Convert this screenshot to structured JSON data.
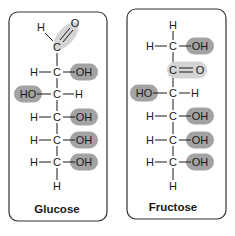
{
  "colors": {
    "hydroxyl_highlight": "#a3a3a3",
    "carbonyl_highlight": "#d4d4d4",
    "text": "#1a1a1a",
    "border": "#333333"
  },
  "molecules": [
    {
      "name": "Glucose",
      "box": {
        "x": 9,
        "y": 12,
        "w": 98,
        "h": 209
      },
      "carbon_x": 57,
      "label_y": 209,
      "top_group": {
        "type": "aldehyde",
        "c_y": 47,
        "h_label": "H",
        "o_label": "O",
        "c_label": "C"
      },
      "rows": [
        {
          "y": 72,
          "left": "H",
          "right": "OH",
          "highlight": "right"
        },
        {
          "y": 94,
          "left": "HO",
          "right": "H",
          "highlight": "left"
        },
        {
          "y": 117,
          "left": "H",
          "right": "OH",
          "highlight": "right"
        },
        {
          "y": 140,
          "left": "H",
          "right": "OH",
          "highlight": "right"
        },
        {
          "y": 162,
          "left": "H",
          "right": "OH",
          "highlight": "right"
        }
      ],
      "bottom_h": {
        "y": 186,
        "label": "H"
      }
    },
    {
      "name": "Fructose",
      "box": {
        "x": 127,
        "y": 9,
        "w": 99,
        "h": 210
      },
      "carbon_x": 173,
      "label_y": 207,
      "top_h": {
        "y": 25,
        "label": "H"
      },
      "rows": [
        {
          "y": 46,
          "left": "H",
          "right": "OH",
          "highlight": "right"
        },
        {
          "y": 70,
          "type": "ketone",
          "c_label": "C",
          "o_label": "O"
        },
        {
          "y": 93,
          "left": "HO",
          "right": "H",
          "highlight": "left"
        },
        {
          "y": 116,
          "left": "H",
          "right": "OH",
          "highlight": "right"
        },
        {
          "y": 140,
          "left": "H",
          "right": "OH",
          "highlight": "right"
        },
        {
          "y": 162,
          "left": "H",
          "right": "OH",
          "highlight": "right"
        }
      ],
      "bottom_h": {
        "y": 186,
        "label": "H"
      }
    }
  ]
}
